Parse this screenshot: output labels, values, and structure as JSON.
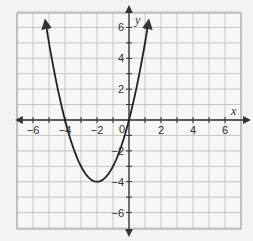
{
  "chart_data": {
    "type": "line",
    "title": "",
    "xlabel": "x",
    "ylabel": "y",
    "xlim": [
      -7,
      7
    ],
    "ylim": [
      -7,
      7
    ],
    "grid": true,
    "legend": null,
    "x_ticks": [
      -6,
      -4,
      -2,
      2,
      4,
      6
    ],
    "y_ticks": [
      -6,
      -4,
      -2,
      2,
      4,
      6
    ],
    "x_tick_labels": [
      "−6",
      "−4",
      "−2",
      "2",
      "4",
      "6"
    ],
    "y_tick_labels": [
      "−6",
      "−4",
      "−2",
      "2",
      "4",
      "6"
    ],
    "origin_label": "0",
    "series": [
      {
        "name": "parabola",
        "equation": "y = x^2 + 4x",
        "vertex": [
          -2,
          -4
        ],
        "x_intercepts": [
          -4,
          0
        ],
        "y_intercept": 0,
        "x": [
          -5.2,
          -5,
          -4,
          -3,
          -2,
          -1,
          0,
          1,
          1.2
        ],
        "values": [
          6.24,
          5,
          0,
          -3,
          -4,
          -3,
          0,
          5,
          6.24
        ],
        "color": "#222222",
        "arrows_at_ends": true
      }
    ]
  },
  "colors": {
    "background": "#f3f3f1",
    "grid": "#b9b9b9",
    "axis": "#333333",
    "curve": "#222222"
  }
}
